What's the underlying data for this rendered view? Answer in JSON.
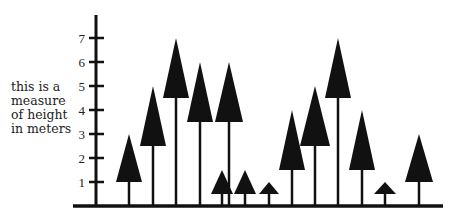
{
  "chart_data": {
    "type": "bar",
    "title": "",
    "xlabel": "",
    "ylabel": "this is a measure of height in meters",
    "ylabel_lines": [
      "this is a",
      "measure",
      "of height",
      "in meters"
    ],
    "yticks": [
      1,
      2,
      3,
      4,
      5,
      6,
      7
    ],
    "ylim": [
      0,
      7.8
    ],
    "grid": false,
    "legend": null,
    "trees": [
      {
        "id": 1,
        "x": 129,
        "height": 3.0,
        "crown_base": 1.0,
        "crown_halfwidth": 13
      },
      {
        "id": 2,
        "x": 153,
        "height": 5.0,
        "crown_base": 2.5,
        "crown_halfwidth": 13
      },
      {
        "id": 3,
        "x": 176,
        "height": 7.0,
        "crown_base": 4.5,
        "crown_halfwidth": 13
      },
      {
        "id": 4,
        "x": 200,
        "height": 6.0,
        "crown_base": 3.5,
        "crown_halfwidth": 13
      },
      {
        "id": 5,
        "x": 229,
        "height": 6.0,
        "crown_base": 3.5,
        "crown_halfwidth": 14
      },
      {
        "id": 6,
        "x": 222,
        "height": 1.5,
        "crown_base": 0.5,
        "crown_halfwidth": 11
      },
      {
        "id": 7,
        "x": 245,
        "height": 1.5,
        "crown_base": 0.5,
        "crown_halfwidth": 11
      },
      {
        "id": 8,
        "x": 269,
        "height": 1.0,
        "crown_base": 0.5,
        "crown_halfwidth": 10
      },
      {
        "id": 9,
        "x": 292,
        "height": 4.0,
        "crown_base": 1.5,
        "crown_halfwidth": 13
      },
      {
        "id": 10,
        "x": 315,
        "height": 5.0,
        "crown_base": 2.5,
        "crown_halfwidth": 15
      },
      {
        "id": 11,
        "x": 338,
        "height": 7.0,
        "crown_base": 4.5,
        "crown_halfwidth": 13
      },
      {
        "id": 12,
        "x": 362,
        "height": 4.0,
        "crown_base": 1.5,
        "crown_halfwidth": 13
      },
      {
        "id": 13,
        "x": 385,
        "height": 1.0,
        "crown_base": 0.5,
        "crown_halfwidth": 11
      },
      {
        "id": 14,
        "x": 419,
        "height": 3.0,
        "crown_base": 1.0,
        "crown_halfwidth": 14
      }
    ],
    "values": [
      3,
      5,
      7,
      6,
      6,
      1.5,
      1.5,
      1,
      4,
      5,
      7,
      4,
      1,
      3
    ]
  },
  "layout": {
    "axis_x": 96,
    "axis_top": 15,
    "ground_y": 206,
    "ground_x1": 73,
    "ground_x2": 443,
    "px_per_meter": 24,
    "ink": "#111111"
  }
}
